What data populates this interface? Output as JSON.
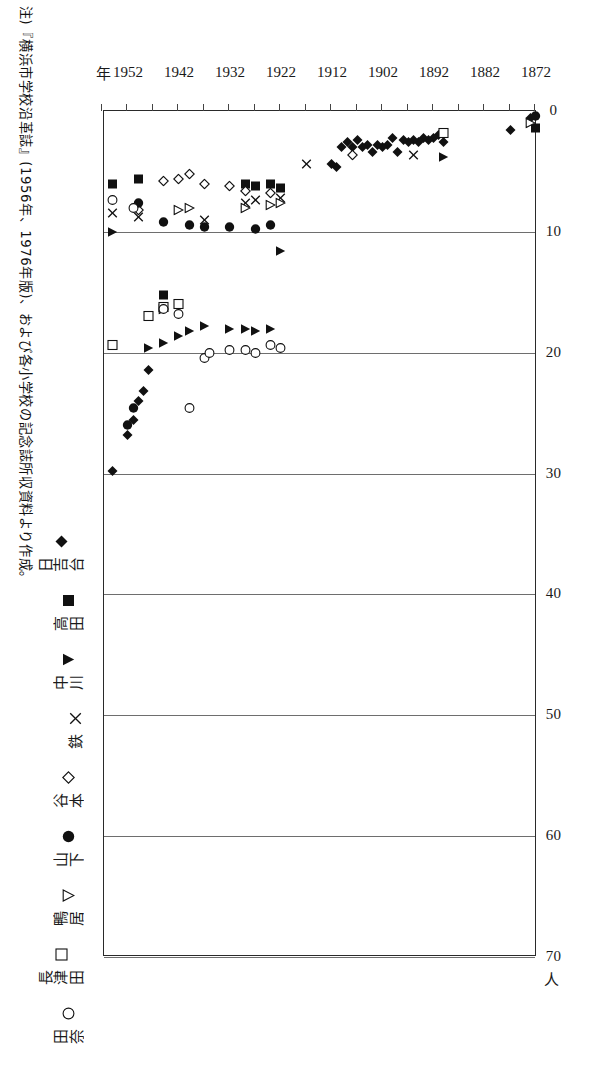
{
  "note": {
    "text": "注)『横浜市学校沿革誌』(1956年、1976年版)、および各小学校の記念誌所収資料より作成。"
  },
  "axes": {
    "value_axis_unit": "人",
    "category_axis_unit": "年",
    "value_ticks": [
      "0",
      "10",
      "20",
      "30",
      "40",
      "50",
      "60",
      "70"
    ],
    "year_ticks": [
      "1872",
      "1882",
      "1892",
      "1902",
      "1912",
      "1922",
      "1932",
      "1942",
      "1952"
    ]
  },
  "legend": {
    "items": [
      {
        "label": "日吉台",
        "marker": "filled-diamond"
      },
      {
        "label": "高田",
        "marker": "filled-square"
      },
      {
        "label": "中川",
        "marker": "filled-right-triangle"
      },
      {
        "label": "鉄",
        "marker": "cross-x"
      },
      {
        "label": "谷本",
        "marker": "open-diamond"
      },
      {
        "label": "山下",
        "marker": "filled-circle"
      },
      {
        "label": "鴨居",
        "marker": "open-right-triangle"
      },
      {
        "label": "長津田",
        "marker": "open-square"
      },
      {
        "label": "田奈",
        "marker": "open-circle"
      }
    ]
  },
  "chart_data": {
    "type": "scatter",
    "title": "",
    "xlabel": "人",
    "ylabel": "年",
    "xlim": [
      0,
      70
    ],
    "ylim": [
      1872,
      1957
    ],
    "grid": true,
    "legend_position": "bottom",
    "note": "横軸は人数(人)、縦軸は年。マーカーは小学校別。",
    "series": [
      {
        "name": "日吉台",
        "marker": "filled-diamond",
        "points": [
          [
            0.6,
            1873
          ],
          [
            1.6,
            1877
          ],
          [
            2.6,
            1890
          ],
          [
            2.0,
            1891
          ],
          [
            2.2,
            1892
          ],
          [
            2.4,
            1893
          ],
          [
            2.2,
            1894
          ],
          [
            2.6,
            1895
          ],
          [
            2.4,
            1896
          ],
          [
            2.6,
            1897
          ],
          [
            2.4,
            1898
          ],
          [
            3.4,
            1899
          ],
          [
            2.2,
            1900
          ],
          [
            2.8,
            1901
          ],
          [
            3.0,
            1902
          ],
          [
            2.8,
            1903
          ],
          [
            3.4,
            1904
          ],
          [
            2.8,
            1905
          ],
          [
            3.0,
            1906
          ],
          [
            2.4,
            1907
          ],
          [
            3.0,
            1908
          ],
          [
            2.6,
            1909
          ],
          [
            3.0,
            1910
          ],
          [
            4.6,
            1911
          ],
          [
            4.4,
            1912
          ],
          [
            21.4,
            1948
          ],
          [
            23.2,
            1949
          ],
          [
            24.0,
            1950
          ],
          [
            25.6,
            1951
          ],
          [
            26.8,
            1952
          ],
          [
            29.8,
            1955
          ]
        ]
      },
      {
        "name": "高田",
        "marker": "filled-square",
        "points": [
          [
            1.4,
            1872
          ],
          [
            6.4,
            1922
          ],
          [
            6.0,
            1924
          ],
          [
            6.2,
            1927
          ],
          [
            6.0,
            1929
          ],
          [
            15.2,
            1945
          ],
          [
            5.6,
            1950
          ],
          [
            6.0,
            1955
          ]
        ]
      },
      {
        "name": "中川",
        "marker": "filled-right-triangle",
        "points": [
          [
            3.8,
            1890
          ],
          [
            11.6,
            1922
          ],
          [
            18.0,
            1924
          ],
          [
            18.2,
            1927
          ],
          [
            18.0,
            1929
          ],
          [
            18.0,
            1932
          ],
          [
            17.8,
            1937
          ],
          [
            18.2,
            1940
          ],
          [
            18.6,
            1942
          ],
          [
            19.2,
            1945
          ],
          [
            19.6,
            1948
          ],
          [
            10.0,
            1955
          ]
        ]
      },
      {
        "name": "鉄",
        "marker": "cross-x",
        "points": [
          [
            3.6,
            1896
          ],
          [
            4.4,
            1917
          ],
          [
            7.2,
            1922
          ],
          [
            7.4,
            1927
          ],
          [
            7.6,
            1929
          ],
          [
            9.0,
            1937
          ],
          [
            8.8,
            1950
          ],
          [
            8.4,
            1955
          ]
        ]
      },
      {
        "name": "谷本",
        "marker": "open-diamond",
        "points": [
          [
            3.6,
            1908
          ],
          [
            6.8,
            1924
          ],
          [
            6.6,
            1929
          ],
          [
            6.2,
            1932
          ],
          [
            6.0,
            1937
          ],
          [
            5.2,
            1940
          ],
          [
            5.6,
            1942
          ],
          [
            5.8,
            1945
          ],
          [
            8.2,
            1950
          ]
        ]
      },
      {
        "name": "山下",
        "marker": "filled-circle",
        "points": [
          [
            0.4,
            1872
          ],
          [
            9.4,
            1924
          ],
          [
            9.8,
            1927
          ],
          [
            9.6,
            1932
          ],
          [
            9.6,
            1937
          ],
          [
            9.4,
            1940
          ],
          [
            9.2,
            1945
          ],
          [
            7.6,
            1950
          ],
          [
            24.6,
            1951
          ],
          [
            26.0,
            1952
          ]
        ]
      },
      {
        "name": "鴨居",
        "marker": "open-right-triangle",
        "points": [
          [
            1.0,
            1873
          ],
          [
            7.6,
            1922
          ],
          [
            7.8,
            1924
          ],
          [
            8.0,
            1929
          ],
          [
            8.0,
            1940
          ],
          [
            8.2,
            1942
          ],
          [
            16.4,
            1945
          ]
        ]
      },
      {
        "name": "長津田",
        "marker": "open-square",
        "points": [
          [
            1.8,
            1890
          ],
          [
            16.0,
            1942
          ],
          [
            16.2,
            1945
          ],
          [
            17.0,
            1948
          ],
          [
            19.4,
            1955
          ]
        ]
      },
      {
        "name": "田奈",
        "marker": "open-circle",
        "points": [
          [
            19.6,
            1922
          ],
          [
            19.4,
            1924
          ],
          [
            20.0,
            1927
          ],
          [
            19.8,
            1929
          ],
          [
            19.8,
            1932
          ],
          [
            20.4,
            1937
          ],
          [
            20.0,
            1936
          ],
          [
            24.6,
            1940
          ],
          [
            16.8,
            1942
          ],
          [
            16.4,
            1945
          ],
          [
            8.0,
            1951
          ],
          [
            7.4,
            1955
          ]
        ]
      }
    ]
  }
}
